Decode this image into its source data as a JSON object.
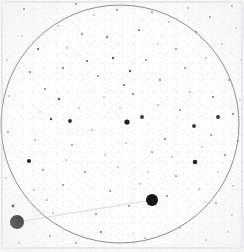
{
  "chart_data": {
    "type": "scatter",
    "title": "",
    "subtitle": "",
    "xlabel": "",
    "ylabel": "",
    "grid": false,
    "legend": "none",
    "axis_visible": false,
    "xlim": [
      0,
      244
    ],
    "ylim": [
      0,
      252
    ],
    "background_color": "#fdfdfd",
    "frame": {
      "name": "plate-border",
      "x": 2,
      "y": 2,
      "width": 240,
      "height": 246,
      "stroke": "#c9c9cf",
      "stroke_width": 0.8
    },
    "field_circle": {
      "name": "field-of-view-circle",
      "cx": 120,
      "cy": 124,
      "r": 119,
      "stroke": "#6f6f77",
      "stroke_width": 0.9,
      "fill": "none"
    },
    "motion_track": {
      "name": "object-motion-track",
      "x1": 17,
      "y1": 222,
      "x2": 152,
      "y2": 200,
      "stroke": "#cfcfd6",
      "stroke_width": 0.8
    },
    "marked_objects": [
      {
        "label": "object-a",
        "cx": 17,
        "cy": 222,
        "r": 7.0,
        "color": "#141414"
      },
      {
        "label": "object-b",
        "cx": 152,
        "cy": 200,
        "r": 6.0,
        "color": "#141414"
      }
    ],
    "stars": [
      {
        "cx": 127,
        "cy": 122,
        "r": 2.6,
        "color": "#1e1e22"
      },
      {
        "cx": 142,
        "cy": 117,
        "r": 1.9,
        "color": "#333338"
      },
      {
        "cx": 70,
        "cy": 121,
        "r": 1.9,
        "color": "#2b2b30"
      },
      {
        "cx": 195,
        "cy": 162,
        "r": 2.3,
        "color": "#242428"
      },
      {
        "cx": 194,
        "cy": 126,
        "r": 1.9,
        "color": "#34343a"
      },
      {
        "cx": 218,
        "cy": 117,
        "r": 1.9,
        "color": "#303035"
      },
      {
        "cx": 29,
        "cy": 161,
        "r": 2.1,
        "color": "#272730"
      },
      {
        "cx": 13,
        "cy": 206,
        "r": 1.4,
        "color": "#3a3a40"
      },
      {
        "cx": 51,
        "cy": 119,
        "r": 1.2,
        "color": "#4a4a52"
      },
      {
        "cx": 59,
        "cy": 99,
        "r": 1.2,
        "color": "#50505a"
      },
      {
        "cx": 38,
        "cy": 49,
        "r": 1.1,
        "color": "#5a5a64"
      },
      {
        "cx": 24,
        "cy": 9,
        "r": 1.0,
        "color": "#62626c"
      },
      {
        "cx": 76,
        "cy": 4,
        "r": 1.0,
        "color": "#6a6a74"
      },
      {
        "cx": 117,
        "cy": 10,
        "r": 0.9,
        "color": "#70707a"
      },
      {
        "cx": 152,
        "cy": 12,
        "r": 0.9,
        "color": "#74747e"
      },
      {
        "cx": 210,
        "cy": 17,
        "r": 0.9,
        "color": "#7a7a84"
      },
      {
        "cx": 232,
        "cy": 6,
        "r": 0.9,
        "color": "#7a7a84"
      },
      {
        "cx": 196,
        "cy": 32,
        "r": 1.0,
        "color": "#6e6e78"
      },
      {
        "cx": 169,
        "cy": 22,
        "r": 0.8,
        "color": "#80808a"
      },
      {
        "cx": 139,
        "cy": 30,
        "r": 1.0,
        "color": "#6c6c76"
      },
      {
        "cx": 107,
        "cy": 37,
        "r": 1.1,
        "color": "#62626c"
      },
      {
        "cx": 82,
        "cy": 34,
        "r": 0.9,
        "color": "#72727c"
      },
      {
        "cx": 58,
        "cy": 26,
        "r": 0.8,
        "color": "#7c7c86"
      },
      {
        "cx": 30,
        "cy": 72,
        "r": 1.0,
        "color": "#6a6a74"
      },
      {
        "cx": 45,
        "cy": 89,
        "r": 0.9,
        "color": "#74747e"
      },
      {
        "cx": 63,
        "cy": 68,
        "r": 1.0,
        "color": "#6c6c76"
      },
      {
        "cx": 87,
        "cy": 61,
        "r": 1.1,
        "color": "#63636d"
      },
      {
        "cx": 98,
        "cy": 76,
        "r": 0.9,
        "color": "#76767f"
      },
      {
        "cx": 113,
        "cy": 58,
        "r": 1.2,
        "color": "#5c5c66"
      },
      {
        "cx": 130,
        "cy": 71,
        "r": 1.2,
        "color": "#5e5e68"
      },
      {
        "cx": 124,
        "cy": 85,
        "r": 1.1,
        "color": "#646470"
      },
      {
        "cx": 133,
        "cy": 94,
        "r": 1.0,
        "color": "#6a6a74"
      },
      {
        "cx": 146,
        "cy": 60,
        "r": 0.9,
        "color": "#76767f"
      },
      {
        "cx": 160,
        "cy": 80,
        "r": 1.0,
        "color": "#6e6e78"
      },
      {
        "cx": 176,
        "cy": 49,
        "r": 0.9,
        "color": "#787882"
      },
      {
        "cx": 185,
        "cy": 68,
        "r": 0.9,
        "color": "#76767f"
      },
      {
        "cx": 206,
        "cy": 58,
        "r": 0.8,
        "color": "#80808a"
      },
      {
        "cx": 222,
        "cy": 44,
        "r": 0.8,
        "color": "#82828c"
      },
      {
        "cx": 229,
        "cy": 80,
        "r": 0.9,
        "color": "#7a7a84"
      },
      {
        "cx": 213,
        "cy": 97,
        "r": 1.0,
        "color": "#70707a"
      },
      {
        "cx": 233,
        "cy": 114,
        "r": 1.0,
        "color": "#6e6e78"
      },
      {
        "cx": 238,
        "cy": 141,
        "r": 0.9,
        "color": "#76767f"
      },
      {
        "cx": 225,
        "cy": 155,
        "r": 0.9,
        "color": "#787882"
      },
      {
        "cx": 211,
        "cy": 135,
        "r": 0.9,
        "color": "#7a7a84"
      },
      {
        "cx": 180,
        "cy": 110,
        "r": 0.9,
        "color": "#7c7c86"
      },
      {
        "cx": 165,
        "cy": 139,
        "r": 1.0,
        "color": "#70707a"
      },
      {
        "cx": 152,
        "cy": 152,
        "r": 0.9,
        "color": "#7a7a84"
      },
      {
        "cx": 176,
        "cy": 176,
        "r": 0.9,
        "color": "#7a7a84"
      },
      {
        "cx": 199,
        "cy": 189,
        "r": 0.8,
        "color": "#82828c"
      },
      {
        "cx": 216,
        "cy": 203,
        "r": 0.9,
        "color": "#7c7c86"
      },
      {
        "cx": 233,
        "cy": 186,
        "r": 0.8,
        "color": "#84848e"
      },
      {
        "cx": 167,
        "cy": 196,
        "r": 0.9,
        "color": "#7a7a84"
      },
      {
        "cx": 140,
        "cy": 184,
        "r": 0.8,
        "color": "#84848e"
      },
      {
        "cx": 129,
        "cy": 206,
        "r": 0.9,
        "color": "#7e7e88"
      },
      {
        "cx": 110,
        "cy": 191,
        "r": 0.9,
        "color": "#7c7c86"
      },
      {
        "cx": 96,
        "cy": 214,
        "r": 0.9,
        "color": "#7a7a84"
      },
      {
        "cx": 85,
        "cy": 172,
        "r": 0.9,
        "color": "#7a7a84"
      },
      {
        "cx": 63,
        "cy": 185,
        "r": 0.9,
        "color": "#7e7e88"
      },
      {
        "cx": 47,
        "cy": 200,
        "r": 0.8,
        "color": "#84848e"
      },
      {
        "cx": 43,
        "cy": 170,
        "r": 0.9,
        "color": "#7c7c86"
      },
      {
        "cx": 101,
        "cy": 232,
        "r": 1.1,
        "color": "#6a6a74"
      },
      {
        "cx": 50,
        "cy": 236,
        "r": 0.9,
        "color": "#7a7a84"
      },
      {
        "cx": 76,
        "cy": 243,
        "r": 0.9,
        "color": "#7c7c86"
      },
      {
        "cx": 145,
        "cy": 238,
        "r": 0.8,
        "color": "#84848e"
      },
      {
        "cx": 180,
        "cy": 228,
        "r": 0.8,
        "color": "#84848e"
      },
      {
        "cx": 206,
        "cy": 240,
        "r": 0.8,
        "color": "#868690"
      },
      {
        "cx": 228,
        "cy": 232,
        "r": 0.8,
        "color": "#868690"
      },
      {
        "cx": 8,
        "cy": 132,
        "r": 0.9,
        "color": "#7a7a84"
      },
      {
        "cx": 9,
        "cy": 96,
        "r": 0.8,
        "color": "#84848e"
      },
      {
        "cx": 7,
        "cy": 60,
        "r": 0.8,
        "color": "#868690"
      },
      {
        "cx": 6,
        "cy": 178,
        "r": 0.8,
        "color": "#868690"
      },
      {
        "cx": 35,
        "cy": 140,
        "r": 0.8,
        "color": "#84848e"
      },
      {
        "cx": 72,
        "cy": 145,
        "r": 0.9,
        "color": "#7e7e88"
      },
      {
        "cx": 92,
        "cy": 130,
        "r": 0.8,
        "color": "#84848e"
      },
      {
        "cx": 105,
        "cy": 155,
        "r": 0.8,
        "color": "#868690"
      },
      {
        "cx": 118,
        "cy": 167,
        "r": 0.8,
        "color": "#84848e"
      },
      {
        "cx": 158,
        "cy": 105,
        "r": 0.8,
        "color": "#868690"
      },
      {
        "cx": 190,
        "cy": 92,
        "r": 0.8,
        "color": "#84848e"
      },
      {
        "cx": 67,
        "cy": 48,
        "r": 0.8,
        "color": "#868690"
      },
      {
        "cx": 94,
        "cy": 15,
        "r": 0.8,
        "color": "#888892"
      },
      {
        "cx": 188,
        "cy": 8,
        "r": 0.8,
        "color": "#888892"
      },
      {
        "cx": 236,
        "cy": 28,
        "r": 0.8,
        "color": "#888892"
      },
      {
        "cx": 19,
        "cy": 243,
        "r": 0.8,
        "color": "#888892"
      },
      {
        "cx": 232,
        "cy": 215,
        "r": 0.8,
        "color": "#888892"
      },
      {
        "cx": 53,
        "cy": 213,
        "r": 0.8,
        "color": "#868690"
      },
      {
        "cx": 34,
        "cy": 190,
        "r": 0.8,
        "color": "#868690"
      },
      {
        "cx": 126,
        "cy": 143,
        "r": 0.7,
        "color": "#8a8a94"
      },
      {
        "cx": 148,
        "cy": 172,
        "r": 0.7,
        "color": "#8a8a94"
      },
      {
        "cx": 202,
        "cy": 147,
        "r": 0.7,
        "color": "#8a8a94"
      },
      {
        "cx": 172,
        "cy": 157,
        "r": 0.7,
        "color": "#8a8a94"
      },
      {
        "cx": 79,
        "cy": 108,
        "r": 0.7,
        "color": "#8a8a94"
      },
      {
        "cx": 40,
        "cy": 112,
        "r": 0.7,
        "color": "#8a8a94"
      },
      {
        "cx": 22,
        "cy": 36,
        "r": 0.7,
        "color": "#8c8c96"
      },
      {
        "cx": 158,
        "cy": 44,
        "r": 0.7,
        "color": "#8c8c96"
      },
      {
        "cx": 120,
        "cy": 108,
        "r": 0.7,
        "color": "#8a8a94"
      },
      {
        "cx": 104,
        "cy": 97,
        "r": 0.7,
        "color": "#8c8c96"
      },
      {
        "cx": 66,
        "cy": 160,
        "r": 0.7,
        "color": "#8c8c96"
      },
      {
        "cx": 218,
        "cy": 172,
        "r": 0.7,
        "color": "#8c8c96"
      },
      {
        "cx": 240,
        "cy": 100,
        "r": 0.7,
        "color": "#8c8c96"
      },
      {
        "cx": 241,
        "cy": 60,
        "r": 0.7,
        "color": "#8e8e98"
      }
    ]
  }
}
